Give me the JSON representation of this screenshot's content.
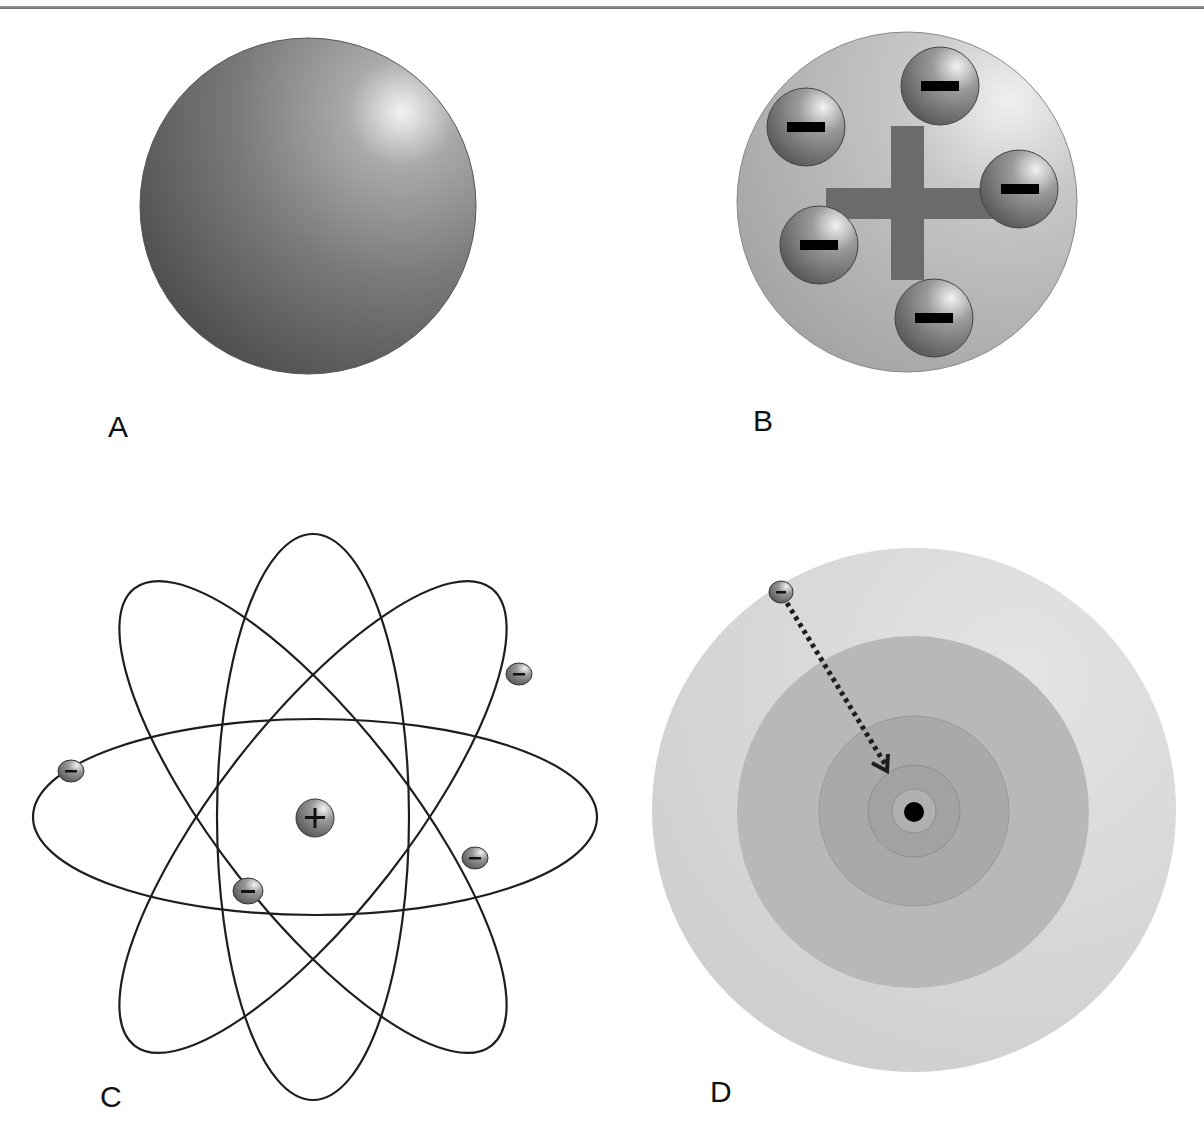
{
  "figure": {
    "panels": [
      {
        "id": "A",
        "label": "A",
        "model": "solid sphere"
      },
      {
        "id": "B",
        "label": "B",
        "model": "positive sphere with embedded electrons",
        "nucleus_symbol": "+",
        "electron_symbol": "−",
        "electron_count": 5
      },
      {
        "id": "C",
        "label": "C",
        "model": "nucleus with elliptical electron orbits",
        "nucleus_symbol": "+",
        "electron_symbol": "−",
        "orbit_count": 3,
        "electron_count": 4
      },
      {
        "id": "D",
        "label": "D",
        "model": "concentric shells with electron falling toward nucleus",
        "electron_symbol": "−",
        "shell_count": 4
      }
    ],
    "colors": {
      "sphere_dark": "#5a5a5a",
      "sphere_light": "#e8e8e8",
      "shell_outer": "#d4d4d4",
      "shell_mid": "#b5b5b5",
      "shell_inner": "#a4a4a4",
      "plus_bar": "#6b6b6b",
      "line": "#1e1e1e"
    }
  }
}
